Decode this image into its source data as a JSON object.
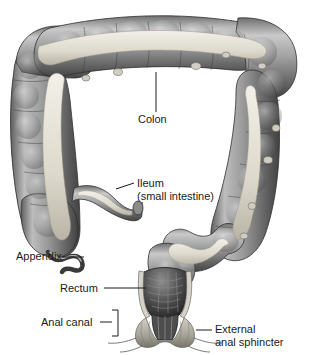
{
  "figure": {
    "style": "grayscale medical illustration",
    "background_color": "#ffffff",
    "ink_color": "#1a1a1a",
    "tissue_light": "#d8d8d8",
    "tissue_mid": "#9a9a9a",
    "tissue_dark": "#4a4a4a",
    "taenia_color": "#e8e6dd"
  },
  "labels": {
    "colon": "Colon",
    "ileum_line1": "Ileum",
    "ileum_line2": "(small intestine)",
    "appendix": "Appendix",
    "rectum": "Rectum",
    "anal_canal": "Anal canal",
    "sphincter_line1": "External",
    "sphincter_line2": "anal sphincter"
  },
  "structures": [
    {
      "name": "transverse-colon",
      "label_key": "colon"
    },
    {
      "name": "ascending-colon",
      "label_key": "colon"
    },
    {
      "name": "descending-colon",
      "label_key": "colon"
    },
    {
      "name": "cecum",
      "label_key": "colon"
    },
    {
      "name": "ileum",
      "label_key": "ileum_line1"
    },
    {
      "name": "appendix",
      "label_key": "appendix"
    },
    {
      "name": "sigmoid-colon",
      "label_key": "colon"
    },
    {
      "name": "rectum",
      "label_key": "rectum"
    },
    {
      "name": "anal-canal",
      "label_key": "anal_canal"
    },
    {
      "name": "external-anal-sphincter",
      "label_key": "sphincter_line1"
    }
  ]
}
